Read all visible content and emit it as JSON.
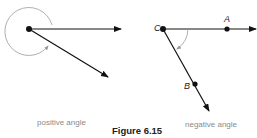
{
  "figure": {
    "caption": "Figure 6.15",
    "left": {
      "label": "positive angle"
    },
    "right": {
      "label": "negative angle",
      "points": {
        "A": "A",
        "B": "B",
        "C": "C"
      }
    }
  }
}
